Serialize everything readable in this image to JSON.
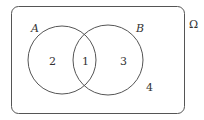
{
  "diagram": {
    "type": "venn",
    "universe": {
      "label": "Ω",
      "region_label": "4"
    },
    "sets": [
      {
        "name": "A",
        "label": "A",
        "only_region_label": "2"
      },
      {
        "name": "B",
        "label": "B",
        "only_region_label": "3"
      }
    ],
    "intersection": {
      "label": "1"
    },
    "colors": {
      "stroke": "#555555",
      "text": "#333333",
      "background": "#ffffff"
    }
  }
}
